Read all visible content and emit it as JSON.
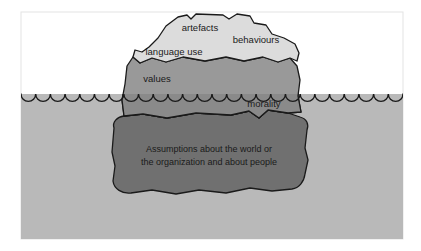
{
  "figure": {
    "name": "cultural-iceberg-diagram",
    "background_color": "#ffffff",
    "frame": {
      "border_color": "#e3e3e3",
      "x": 21,
      "y": 12,
      "width": 382,
      "height": 227
    },
    "water": {
      "surface_y": 94,
      "color": "#b9b9b9",
      "wave_color": "#1a1a1a",
      "wave_count": 26,
      "wave_radius": 7.3
    },
    "iceberg": {
      "tip": {
        "label_group": "visible-culture",
        "fill": "#dcdcdc",
        "stroke": "#1a1a1a",
        "labels": [
          {
            "id": "artefacts",
            "text": "artefacts",
            "x": 200,
            "y": 31,
            "anchor": "middle"
          },
          {
            "id": "behaviours",
            "text": "behaviours",
            "x": 256,
            "y": 43,
            "anchor": "middle"
          },
          {
            "id": "language-use",
            "text": "language use",
            "x": 174,
            "y": 55,
            "anchor": "middle"
          }
        ]
      },
      "middle": {
        "label_group": "shallow-culture",
        "fill": "#999999",
        "fill_submerged": "#8a8a8a",
        "stroke": "#1a1a1a",
        "labels": [
          {
            "id": "values",
            "text": "values",
            "x": 157,
            "y": 82,
            "anchor": "middle"
          },
          {
            "id": "morality",
            "text": "morality",
            "x": 264,
            "y": 107,
            "anchor": "middle"
          }
        ]
      },
      "base": {
        "label_group": "deep-culture",
        "fill": "#707070",
        "stroke": "#1a1a1a",
        "labels": [
          {
            "id": "assumptions-line-1",
            "text": "Assumptions about the world or",
            "x": 209,
            "y": 152,
            "anchor": "middle"
          },
          {
            "id": "assumptions-line-2",
            "text": "the organization and about people",
            "x": 209,
            "y": 165,
            "anchor": "middle"
          }
        ]
      }
    }
  }
}
